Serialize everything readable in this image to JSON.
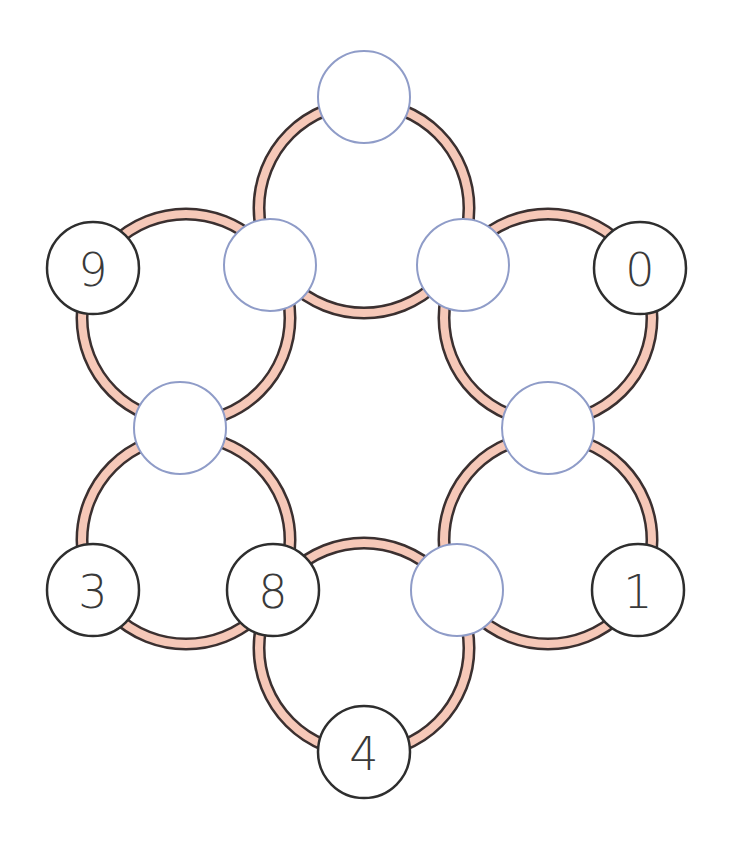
{
  "puzzle": {
    "colors": {
      "background": "#ffffff",
      "ring_fill": "#f6c8b8",
      "ring_outline": "#3b3030",
      "given_node_stroke": "#2e2e2e",
      "empty_node_stroke": "#8f9cc8",
      "node_fill": "#ffffff"
    },
    "rings": [
      {
        "id": "top",
        "cx": 364,
        "cy": 208,
        "r": 105
      },
      {
        "id": "upper-left",
        "cx": 186,
        "cy": 318,
        "r": 104
      },
      {
        "id": "upper-right",
        "cx": 548,
        "cy": 318,
        "r": 104
      },
      {
        "id": "lower-left",
        "cx": 186,
        "cy": 540,
        "r": 104
      },
      {
        "id": "lower-right",
        "cx": 548,
        "cy": 540,
        "r": 104
      },
      {
        "id": "bottom",
        "cx": 364,
        "cy": 648,
        "r": 105
      }
    ],
    "nodes": [
      {
        "id": "top",
        "cx": 364,
        "cy": 97,
        "r": 46,
        "value": "",
        "given": false
      },
      {
        "id": "upper-left-inner",
        "cx": 270,
        "cy": 265,
        "r": 46,
        "value": "",
        "given": false
      },
      {
        "id": "upper-right-inner",
        "cx": 463,
        "cy": 265,
        "r": 46,
        "value": "",
        "given": false
      },
      {
        "id": "left-outer-top",
        "cx": 93,
        "cy": 268,
        "r": 46,
        "value": "9",
        "given": true
      },
      {
        "id": "right-outer-top",
        "cx": 640,
        "cy": 268,
        "r": 46,
        "value": "0",
        "given": true
      },
      {
        "id": "middle-left",
        "cx": 180,
        "cy": 428,
        "r": 46,
        "value": "",
        "given": false
      },
      {
        "id": "middle-right",
        "cx": 548,
        "cy": 428,
        "r": 46,
        "value": "",
        "given": false
      },
      {
        "id": "left-outer-bottom",
        "cx": 93,
        "cy": 590,
        "r": 46,
        "value": "3",
        "given": true
      },
      {
        "id": "lower-left-inner",
        "cx": 273,
        "cy": 590,
        "r": 46,
        "value": "8",
        "given": true
      },
      {
        "id": "lower-right-inner",
        "cx": 457,
        "cy": 590,
        "r": 46,
        "value": "",
        "given": false
      },
      {
        "id": "right-outer-bottom",
        "cx": 638,
        "cy": 590,
        "r": 46,
        "value": "1",
        "given": true
      },
      {
        "id": "bottom",
        "cx": 364,
        "cy": 752,
        "r": 46,
        "value": "4",
        "given": true
      }
    ]
  }
}
